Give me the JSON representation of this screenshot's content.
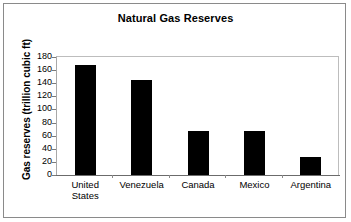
{
  "chart_data": {
    "type": "bar",
    "title": "Natural Gas Reserves",
    "xlabel": "",
    "ylabel": "Gas reserves (trillion cubic ft)",
    "categories": [
      "United States",
      "Venezuela",
      "Canada",
      "Mexico",
      "Argentina"
    ],
    "category_lines": [
      [
        "United",
        "States"
      ],
      [
        "Venezuela"
      ],
      [
        "Canada"
      ],
      [
        "Mexico"
      ],
      [
        "Argentina"
      ]
    ],
    "values": [
      168,
      145,
      67,
      67,
      27
    ],
    "ylim": [
      0,
      180
    ],
    "yticks": [
      0,
      20,
      40,
      60,
      80,
      100,
      120,
      140,
      160,
      180
    ],
    "ytick_labels": [
      "0",
      "20",
      "40",
      "60",
      "80",
      "100",
      "120",
      "140",
      "160",
      "180"
    ],
    "grid": false,
    "legend": false,
    "bar_color": "#000000",
    "series": [
      {
        "name": "Gas reserves",
        "values": [
          168,
          145,
          67,
          67,
          27
        ]
      }
    ]
  }
}
